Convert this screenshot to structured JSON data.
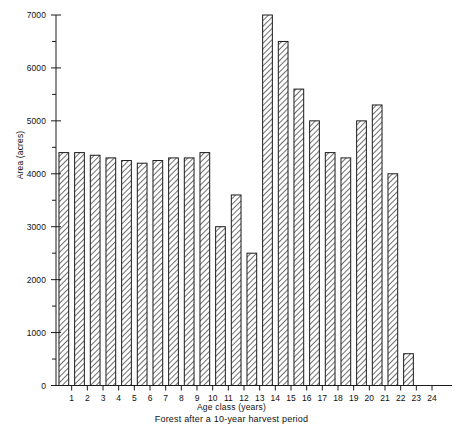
{
  "chart_data": {
    "type": "bar",
    "title": "",
    "subtitle": "",
    "xlabel": "Age class (years)",
    "ylabel": "Area (acres)",
    "caption": "Forest after a 10-year harvest period",
    "categories": [
      "1",
      "2",
      "3",
      "4",
      "5",
      "6",
      "7",
      "8",
      "9",
      "10",
      "11",
      "12",
      "13",
      "14",
      "15",
      "16",
      "17",
      "18",
      "19",
      "20",
      "21",
      "22",
      "23"
    ],
    "values": [
      4400,
      4400,
      4350,
      4300,
      4250,
      4200,
      4250,
      4300,
      4300,
      4400,
      3000,
      3600,
      2500,
      7000,
      6500,
      5600,
      5000,
      4400,
      4300,
      5000,
      5300,
      4000,
      600
    ],
    "xlim": [
      0,
      24
    ],
    "ylim": [
      0,
      7000
    ],
    "yticks": [
      0,
      1000,
      2000,
      3000,
      4000,
      5000,
      6000,
      7000
    ],
    "ytick_labels": [
      "0",
      "1000",
      "2000",
      "3000",
      "4000",
      "5000",
      "6000",
      "7000"
    ],
    "yminor_ticks": [
      500,
      1500,
      2500,
      3500,
      4500,
      5500,
      6500
    ],
    "xticks": [
      1,
      2,
      3,
      4,
      5,
      6,
      7,
      8,
      9,
      10,
      11,
      12,
      13,
      14,
      15,
      16,
      17,
      18,
      19,
      20,
      21,
      22,
      23,
      24
    ],
    "xtick_labels": [
      "1",
      "2",
      "3",
      "4",
      "5",
      "6",
      "7",
      "8",
      "9",
      "10",
      "11",
      "12",
      "13",
      "14",
      "15",
      "16",
      "17",
      "18",
      "19",
      "20",
      "21",
      "22",
      "23",
      "24"
    ],
    "grid": false,
    "legend": null,
    "bar_fill": "hatched-diagonal",
    "bar_edge_color": "#1a1a1a",
    "axis_color": "#1a1a1a",
    "background": "#ffffff"
  }
}
